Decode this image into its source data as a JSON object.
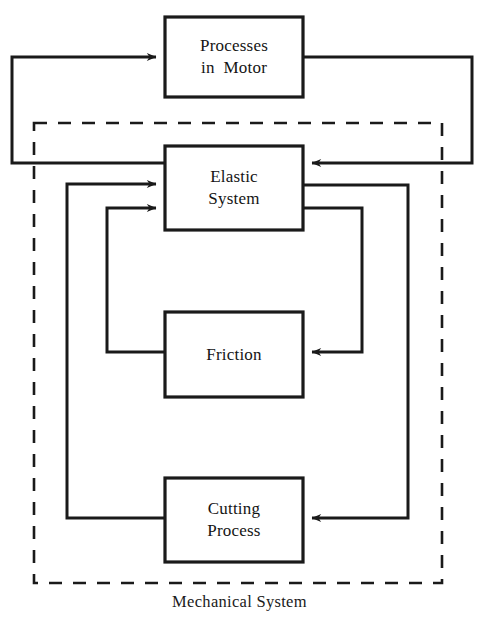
{
  "diagram": {
    "caption": "Mechanical System",
    "colors": {
      "stroke": "#1a1a1a",
      "background": "#ffffff",
      "text": "#141414"
    },
    "blocks": [
      {
        "id": "processes-in-motor",
        "lines": [
          "Processes",
          "in  Motor"
        ],
        "x": 165,
        "y": 17,
        "w": 138,
        "h": 80
      },
      {
        "id": "elastic-system",
        "lines": [
          "Elastic",
          "System"
        ],
        "x": 165,
        "y": 146,
        "w": 138,
        "h": 84
      },
      {
        "id": "friction",
        "lines": [
          "Friction"
        ],
        "x": 165,
        "y": 312,
        "w": 138,
        "h": 85
      },
      {
        "id": "cutting-process",
        "lines": [
          "Cutting",
          "Process"
        ],
        "x": 165,
        "y": 478,
        "w": 138,
        "h": 84
      }
    ],
    "boundary": {
      "id": "mechanical-system-boundary",
      "style": "dashed",
      "x": 34,
      "y": 123,
      "w": 408,
      "h": 460
    },
    "connections": [
      {
        "id": "outer-feedback-to-processes",
        "from": "outer-left-bus",
        "to": "processes-in-motor",
        "arrow": "into-left"
      },
      {
        "id": "processes-to-elastic",
        "from": "processes-in-motor",
        "to": "elastic-system",
        "arrow": "into-right"
      },
      {
        "id": "cutting-to-elastic",
        "from": "cutting-process",
        "to": "elastic-system",
        "arrow": "into-left-upper"
      },
      {
        "id": "friction-to-elastic",
        "from": "friction",
        "to": "elastic-system",
        "arrow": "into-left-lower"
      },
      {
        "id": "elastic-to-friction",
        "from": "elastic-system",
        "to": "friction",
        "arrow": "into-right"
      },
      {
        "id": "elastic-to-cutting",
        "from": "elastic-system",
        "to": "cutting-process",
        "arrow": "into-right"
      }
    ]
  }
}
